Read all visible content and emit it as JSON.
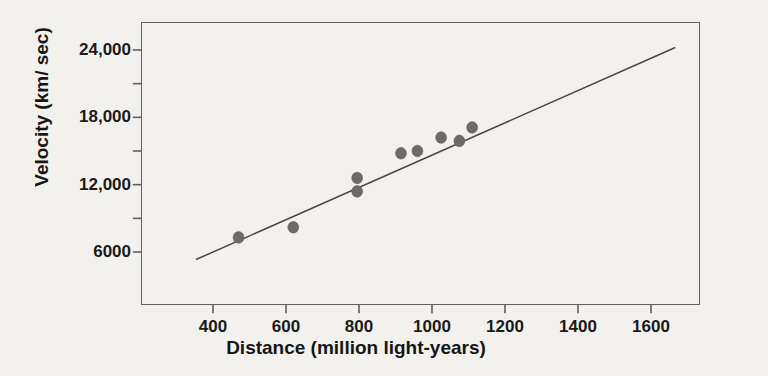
{
  "chart_data": {
    "type": "scatter",
    "title": "",
    "subtitle": "",
    "xlabel": "Distance (million light-years)",
    "ylabel": "Velocity (km/ sec)",
    "xlim": [
      300,
      1720
    ],
    "ylim": [
      3600,
      25600
    ],
    "grid": false,
    "legend": null,
    "x_ticks": [
      400,
      600,
      800,
      1000,
      1200,
      1400,
      1600
    ],
    "x_tick_labels": [
      "400",
      "600",
      "800",
      "1000",
      "1200",
      "1400",
      "1600"
    ],
    "y_ticks": [
      6000,
      9000,
      12000,
      15000,
      18000,
      21000,
      24000
    ],
    "y_tick_labels": [
      "6000",
      "",
      "12,000",
      "",
      "18,000",
      "",
      "24,000"
    ],
    "y_major_labels": [
      "24,000",
      "18,000",
      "12,000",
      "6000"
    ],
    "series": [
      {
        "name": "galaxies",
        "type": "scatter",
        "marker": "circle",
        "color": "#6e6a66",
        "points": [
          {
            "x": 470,
            "y": 7300
          },
          {
            "x": 620,
            "y": 8200
          },
          {
            "x": 795,
            "y": 12600
          },
          {
            "x": 795,
            "y": 11400
          },
          {
            "x": 915,
            "y": 14800
          },
          {
            "x": 960,
            "y": 15000
          },
          {
            "x": 1025,
            "y": 16200
          },
          {
            "x": 1075,
            "y": 15900
          },
          {
            "x": 1110,
            "y": 17100
          }
        ]
      },
      {
        "name": "fit-line",
        "type": "line",
        "color": "#4a4642",
        "x_start": 355,
        "y_start": 5350,
        "x_end": 1665,
        "y_end": 24200
      }
    ],
    "annotations": []
  },
  "colors": {
    "background": "#f2f1ed",
    "frame": "#666058",
    "marker": "#6e6a66",
    "line": "#4a4642",
    "text": "#161616"
  }
}
